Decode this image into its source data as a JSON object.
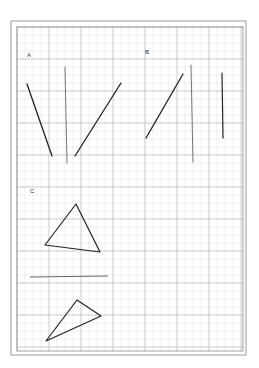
{
  "sheet": {
    "outer_border": {
      "x": 11,
      "y": 21,
      "w": 235,
      "h": 334,
      "color": "#9a9a9a"
    },
    "inner_grid": {
      "x": 17,
      "y": 27,
      "w": 226,
      "h": 324,
      "minor_step": 8,
      "major_step": 32,
      "minor_color": "#dcdcdc",
      "major_color": "#bdbdbd",
      "frame_color": "#8a8a8a"
    }
  },
  "sections": {
    "a": {
      "label": "A",
      "label_pos": [
        27,
        57
      ]
    },
    "b": {
      "label": "B",
      "label_pos": [
        145,
        54
      ]
    },
    "c": {
      "label": "C",
      "label_pos": [
        30,
        193
      ]
    }
  },
  "figures": {
    "a_lines": [
      {
        "name": "a-slant-left-line",
        "x1": 27,
        "y1": 84,
        "x2": 52,
        "y2": 156,
        "color": "#222",
        "width": 1.3
      },
      {
        "name": "a-vertical-line",
        "x1": 65,
        "y1": 67,
        "x2": 67,
        "y2": 163,
        "color": "#666",
        "width": 0.9
      },
      {
        "name": "a-slant-right-line",
        "x1": 75,
        "y1": 156,
        "x2": 121,
        "y2": 83,
        "color": "#222",
        "width": 1.3
      }
    ],
    "b_lines": [
      {
        "name": "b-diagonal-line",
        "x1": 146,
        "y1": 138,
        "x2": 183,
        "y2": 74,
        "color": "#222",
        "width": 1.3
      },
      {
        "name": "b-thin-vertical-line",
        "x1": 191,
        "y1": 65,
        "x2": 193,
        "y2": 162,
        "color": "#666",
        "width": 0.9
      },
      {
        "name": "b-short-vertical-line",
        "x1": 222,
        "y1": 73,
        "x2": 223,
        "y2": 138,
        "color": "#222",
        "width": 1.2
      }
    ],
    "c_triangle_1": {
      "points": "76,204 45,245 100,252",
      "color": "#222",
      "width": 1.2
    },
    "c_divider": {
      "x1": 30,
      "y1": 277,
      "x2": 108,
      "y2": 276,
      "color": "#555",
      "width": 0.9
    },
    "c_triangle_2": {
      "points": "77,300 101,316 46,341",
      "color": "#222",
      "width": 1.2
    }
  }
}
